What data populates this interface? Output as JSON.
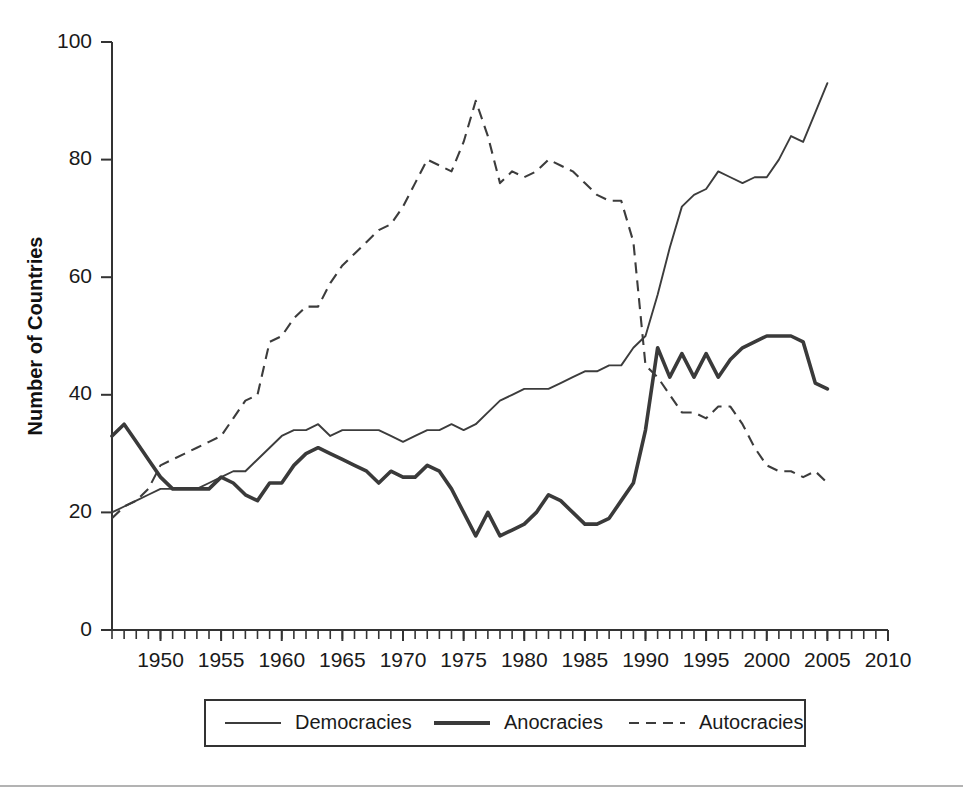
{
  "chart_data": {
    "type": "line",
    "title": "",
    "subtitle": "",
    "xlabel": "",
    "ylabel": "Number of Countries",
    "xlim": [
      1946,
      2010
    ],
    "ylim": [
      0,
      100
    ],
    "grid": false,
    "legend_position": "bottom",
    "x_ticks": [
      1950,
      1955,
      1960,
      1965,
      1970,
      1975,
      1980,
      1985,
      1990,
      1995,
      2000,
      2005,
      2010
    ],
    "y_ticks": [
      0,
      20,
      40,
      60,
      80,
      100
    ],
    "x_minor_tick_interval": 1,
    "x": [
      1946,
      1947,
      1948,
      1949,
      1950,
      1951,
      1952,
      1953,
      1954,
      1955,
      1956,
      1957,
      1958,
      1959,
      1960,
      1961,
      1962,
      1963,
      1964,
      1965,
      1966,
      1967,
      1968,
      1969,
      1970,
      1971,
      1972,
      1973,
      1974,
      1975,
      1976,
      1977,
      1978,
      1979,
      1980,
      1981,
      1982,
      1983,
      1984,
      1985,
      1986,
      1987,
      1988,
      1989,
      1990,
      1991,
      1992,
      1993,
      1994,
      1995,
      1996,
      1997,
      1998,
      1999,
      2000,
      2001,
      2002,
      2003,
      2004,
      2005
    ],
    "series": [
      {
        "name": "Democracies",
        "style": "thin-solid",
        "values": [
          20,
          21,
          22,
          23,
          24,
          24,
          24,
          24,
          25,
          26,
          27,
          27,
          29,
          31,
          33,
          34,
          34,
          35,
          33,
          34,
          34,
          34,
          34,
          33,
          32,
          33,
          34,
          34,
          35,
          34,
          35,
          37,
          39,
          40,
          41,
          41,
          41,
          42,
          43,
          44,
          44,
          45,
          45,
          48,
          50,
          57,
          65,
          72,
          74,
          75,
          78,
          77,
          76,
          77,
          77,
          80,
          84,
          83,
          88,
          93
        ]
      },
      {
        "name": "Anocracies",
        "style": "thick-solid",
        "values": [
          33,
          35,
          32,
          29,
          26,
          24,
          24,
          24,
          24,
          26,
          25,
          23,
          22,
          25,
          25,
          28,
          30,
          31,
          30,
          29,
          28,
          27,
          25,
          27,
          26,
          26,
          28,
          27,
          24,
          20,
          16,
          20,
          16,
          17,
          18,
          20,
          23,
          22,
          20,
          18,
          18,
          19,
          22,
          25,
          34,
          48,
          43,
          47,
          43,
          47,
          43,
          46,
          48,
          49,
          50,
          50,
          50,
          49,
          42,
          41
        ]
      },
      {
        "name": "Autocracies",
        "style": "dashed",
        "values": [
          19,
          21,
          22,
          24,
          28,
          29,
          30,
          31,
          32,
          33,
          36,
          39,
          40,
          49,
          50,
          53,
          55,
          55,
          59,
          62,
          64,
          66,
          68,
          69,
          72,
          76,
          80,
          79,
          78,
          83,
          90,
          84,
          76,
          78,
          77,
          78,
          80,
          79,
          78,
          76,
          74,
          73,
          73,
          66,
          45,
          43,
          40,
          37,
          37,
          36,
          38,
          38,
          35,
          31,
          28,
          27,
          27,
          26,
          27,
          25
        ]
      }
    ]
  },
  "legend": {
    "entries": [
      {
        "label": "Democracies",
        "swatch": "thin-solid-line"
      },
      {
        "label": "Anocracies",
        "swatch": "thick-solid-line"
      },
      {
        "label": "Autocracies",
        "swatch": "dashed-line"
      }
    ]
  },
  "colors": {
    "line": "#3c3c3c",
    "axis": "#333333",
    "text": "#1a1a1a",
    "background": "#ffffff",
    "page_rule": "#9a9a9a"
  }
}
